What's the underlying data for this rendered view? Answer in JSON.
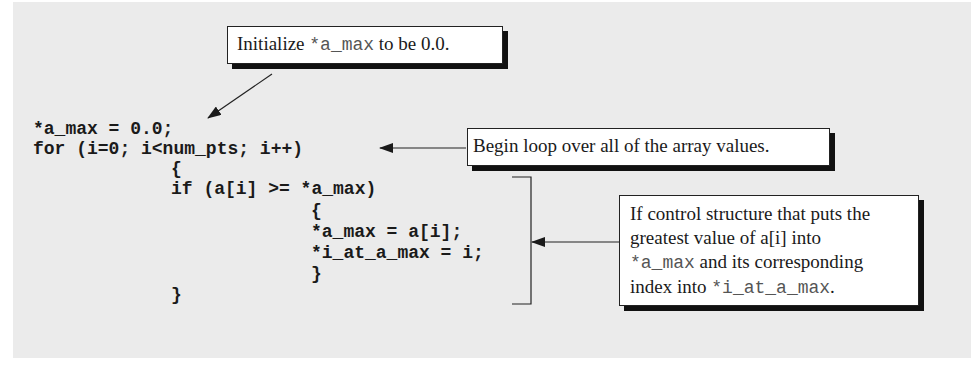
{
  "diagram": {
    "background_color": "#ebebeb",
    "code_lines": [
      "*a_max = 0.0;",
      "for (i=0; i<num_pts; i++)",
      "{",
      "if (a[i] >= *a_max)",
      "{",
      "*a_max = a[i];",
      "*i_at_a_max = i;",
      "}",
      "}"
    ],
    "callouts": [
      {
        "id": "init",
        "parts": [
          {
            "text": "Initialize ",
            "mono": false
          },
          {
            "text": "*a_max",
            "mono": true
          },
          {
            "text": " to be 0.0.",
            "mono": false
          }
        ],
        "points_to": "*a_max = 0.0;"
      },
      {
        "id": "loop",
        "parts": [
          {
            "text": "Begin loop over all of the array values.",
            "mono": false
          }
        ],
        "points_to": "for (i=0; i<num_pts; i++)"
      },
      {
        "id": "if",
        "lines": [
          [
            {
              "text": "If control structure that puts the",
              "mono": false
            }
          ],
          [
            {
              "text": "greatest value of a[i] into",
              "mono": false
            }
          ],
          [
            {
              "text": "*a_max",
              "mono": true
            },
            {
              "text": " and its corresponding",
              "mono": false
            }
          ],
          [
            {
              "text": "index into ",
              "mono": false
            },
            {
              "text": "*i_at_a_max",
              "mono": true
            },
            {
              "text": ".",
              "mono": false
            }
          ]
        ],
        "points_to": "if block (bracket)"
      }
    ]
  }
}
